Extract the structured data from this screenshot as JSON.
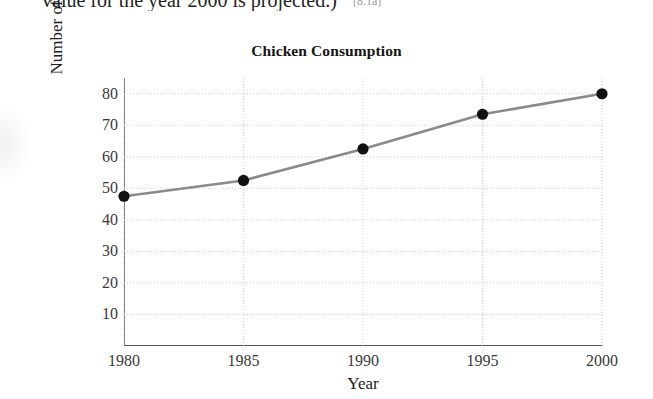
{
  "page": {
    "top_text": "value for the year 2000 is projected.)",
    "reference_tag": "[8.1a]"
  },
  "chart_data": {
    "type": "line",
    "title": "Chicken Consumption",
    "xlabel": "Year",
    "ylabel": "Number of pounds per person",
    "x": [
      1980,
      1985,
      1990,
      1995,
      2000
    ],
    "categories": [
      "1980",
      "1985",
      "1990",
      "1995",
      "2000"
    ],
    "values": [
      47.5,
      52.5,
      62.5,
      73.5,
      80
    ],
    "xtick_labels": [
      "1980",
      "1985",
      "1990",
      "1995",
      "2000"
    ],
    "ytick_labels": [
      "80",
      "70",
      "60",
      "50",
      "40",
      "30",
      "20",
      "10"
    ],
    "ytick_values": [
      80,
      70,
      60,
      50,
      40,
      30,
      20,
      10
    ],
    "xlim": [
      1980,
      2000
    ],
    "ylim": [
      0,
      85
    ],
    "grid": true,
    "grid_style": "dotted",
    "legend": "none",
    "line_color": "#8a8a8a",
    "marker_color": "#111111",
    "marker_shape": "circle",
    "grid_color": "#cfcfcf",
    "axis_color": "#666666"
  }
}
